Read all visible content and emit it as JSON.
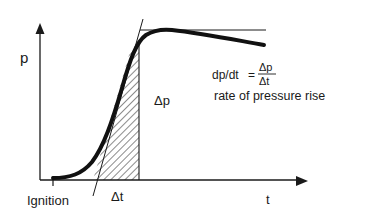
{
  "diagram": {
    "type": "pressure-time curve",
    "y_axis_label": "p",
    "x_axis_label": "t",
    "ignition_label": "Ignition",
    "delta_p_label": "Δp",
    "delta_t_label": "Δt",
    "formula": {
      "lhs": "dp/dt",
      "equals": "=",
      "numerator": "Δp",
      "denominator": "Δt"
    },
    "caption": "rate of pressure rise",
    "colors": {
      "ink": "#1a1a1a",
      "background": "#ffffff"
    }
  }
}
